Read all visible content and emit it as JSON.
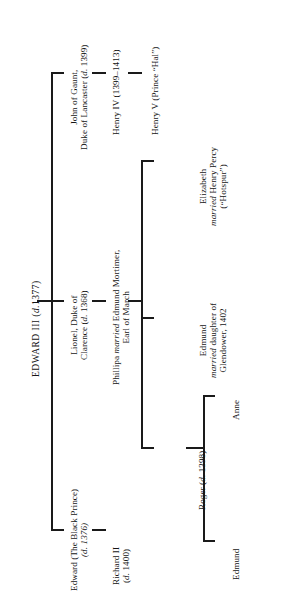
{
  "diagram": {
    "orientation": "rotated-90",
    "ink_color": "#1a1a1a",
    "background_color": "#ffffff"
  },
  "root": {
    "id": "edward-iii",
    "lines": [
      "EDWARD III (d.1377)"
    ],
    "name": "EDWARD III",
    "dates": "(d.1377)"
  },
  "generation2": [
    {
      "id": "edward-black-prince",
      "lines": [
        "Edward (The Black Prince)",
        "(d. 1376)"
      ]
    },
    {
      "id": "lionel-clarence",
      "lines": [
        "Lionel, Duke of",
        "Clarence (d. 1368)"
      ]
    },
    {
      "id": "john-of-gaunt",
      "lines": [
        "John of Gaunt,",
        "Duke of Lancaster (d. 1399)"
      ]
    }
  ],
  "generation3": [
    {
      "id": "richard-ii",
      "lines": [
        "Richard II",
        "(d. 1400)"
      ]
    },
    {
      "id": "phillipa-mortimer",
      "lines": [
        "Phillipa married Edmund Mortimer,",
        "Earl of March"
      ],
      "italic_word": "married"
    },
    {
      "id": "henry-iv",
      "lines": [
        "Henry IV (1399–1413)"
      ]
    }
  ],
  "generation4": [
    {
      "id": "edmund-mortimer-glendower",
      "lines": [
        "Edmund",
        "married daughter of",
        "Glendower, 1402"
      ],
      "italic_word": "married"
    },
    {
      "id": "roger-mortimer",
      "lines": [
        "Roger (d. 1398)"
      ]
    },
    {
      "id": "elizabeth-percy",
      "lines": [
        "Elizabeth",
        "married Henry Percy",
        "(“Hotspur”)"
      ],
      "italic_word": "married"
    },
    {
      "id": "henry-v",
      "lines": [
        "Henry V (Prince “Hal”)"
      ]
    }
  ],
  "generation5": [
    {
      "id": "edmund-mortimer-5",
      "lines": [
        "Edmund"
      ]
    },
    {
      "id": "anne-mortimer",
      "lines": [
        "Anne"
      ]
    }
  ]
}
